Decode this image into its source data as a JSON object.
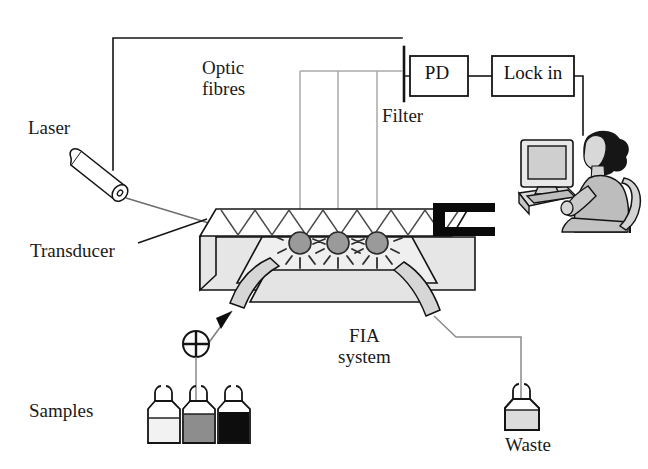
{
  "figure": {
    "background_color": "#ffffff",
    "ink_color": "#111111",
    "accent_gray": "#8f8f8f",
    "fill_gray": "#d9d9d9",
    "bead_gray": "#9a9a9a"
  },
  "labels": {
    "laser": "Laser",
    "optic_fibres": "Optic\nfibres",
    "filter": "Filter",
    "transducer": "Transducer",
    "fia_system": "FIA\nsystem",
    "samples": "Samples",
    "waste": "Waste"
  },
  "boxes": {
    "photodetector": "PD",
    "lock_in": "Lock in"
  },
  "components": [
    {
      "name": "laser-source",
      "label": "Laser",
      "kind": "cylinder"
    },
    {
      "name": "optic-fibre-bundle",
      "label": "Optic fibres",
      "kind": "fibres",
      "count": 3
    },
    {
      "name": "optical-filter",
      "label": "Filter",
      "kind": "bar"
    },
    {
      "name": "photodetector-box",
      "label": "PD",
      "kind": "box"
    },
    {
      "name": "lock-in-amplifier",
      "label": "Lock in",
      "kind": "box"
    },
    {
      "name": "computer-operator",
      "label": "",
      "kind": "clipart"
    },
    {
      "name": "saw-transducer",
      "label": "Transducer",
      "kind": "substrate"
    },
    {
      "name": "fia-system",
      "label": "FIA system",
      "kind": "flow-cell"
    },
    {
      "name": "sample-bottles",
      "label": "Samples",
      "kind": "bottles",
      "count": 3
    },
    {
      "name": "waste-bottle",
      "label": "Waste",
      "kind": "bottle"
    },
    {
      "name": "injection-valve",
      "label": "",
      "kind": "valve"
    }
  ],
  "sample_bottles": [
    {
      "name": "sample-bottle-light",
      "fill": "#f2f2f2"
    },
    {
      "name": "sample-bottle-mid",
      "fill": "#8d8d8d"
    },
    {
      "name": "sample-bottle-dark",
      "fill": "#0d0d0d"
    }
  ],
  "beads": [
    {
      "name": "bead-1"
    },
    {
      "name": "bead-2"
    },
    {
      "name": "bead-3"
    }
  ]
}
